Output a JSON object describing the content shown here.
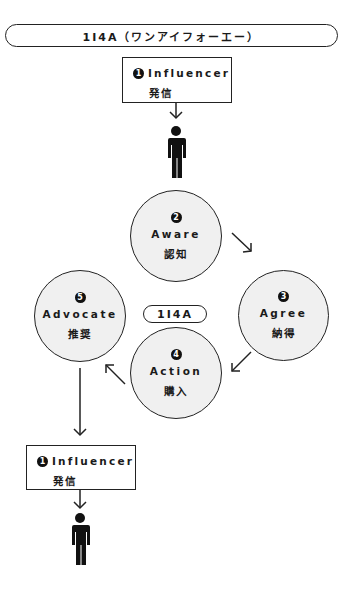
{
  "title": "1I4A（ワンアイフォーエー）",
  "center_label": "1I4A",
  "top_box": {
    "number": "1",
    "label_en": "Influencer",
    "label_jp": "発信"
  },
  "bottom_box": {
    "number": "1",
    "label_en": "Influencer",
    "label_jp": "発信"
  },
  "cycle": [
    {
      "number": "2",
      "label_en": "Aware",
      "label_jp": "認知"
    },
    {
      "number": "3",
      "label_en": "Agree",
      "label_jp": "納得"
    },
    {
      "number": "4",
      "label_en": "Action",
      "label_jp": "購入"
    },
    {
      "number": "5",
      "label_en": "Advocate",
      "label_jp": "推奨"
    }
  ],
  "icons": {
    "person": "person-icon",
    "arrow": "arrow-icon"
  },
  "colors": {
    "circle_fill": "#f0f0f0",
    "stroke": "#222222",
    "person": "#111111"
  }
}
